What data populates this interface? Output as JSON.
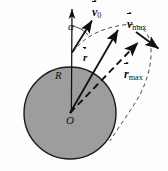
{
  "figure": {
    "width": 168,
    "height": 171,
    "background_color": "#fdfdfd"
  },
  "sphere": {
    "name": "planet-body",
    "center": {
      "x": 70,
      "y": 113
    },
    "radius": 46,
    "fill_color": "#9d9d9d",
    "stroke_color": "#1a1a1a",
    "stroke_width": 1.3
  },
  "labels": {
    "v0": {
      "symbol": "v",
      "subscript": "0",
      "vector": true,
      "text": "v0"
    },
    "vmax": {
      "symbol": "v",
      "subscript": "max",
      "vector": true,
      "text": "vmax"
    },
    "rmax": {
      "symbol": "r",
      "subscript": "max",
      "vector": true,
      "text": "rmax"
    },
    "r": {
      "symbol": "r",
      "subscript": "",
      "vector": true,
      "text": "r"
    },
    "alpha": {
      "symbol": "α",
      "text": "α"
    },
    "R": {
      "symbol": "R",
      "text": "R"
    },
    "O": {
      "symbol": "O",
      "text": "O"
    }
  },
  "geometry": {
    "launch_point": {
      "x": 72,
      "y": 52
    },
    "center_point": {
      "x": 70,
      "y": 113
    },
    "vertical_axis": {
      "x1": 72,
      "y1": 3,
      "x2": 70,
      "y2": 113
    },
    "v0_arrow": {
      "x1": 72,
      "y1": 52,
      "x2": 93,
      "y2": 19
    },
    "r_arrow": {
      "x1": 70,
      "y1": 113,
      "x2": 119,
      "y2": 29
    },
    "rmax_arrow": {
      "x1": 70,
      "y1": 113,
      "x2": 139,
      "y2": 42,
      "dashed": true
    },
    "vmax_arrow": {
      "x1": 136,
      "y1": 32,
      "x2": 159,
      "y2": 49
    },
    "trajectory": {
      "dashed": true,
      "apex": {
        "x": 128,
        "y": 24
      }
    },
    "angle_arc": {
      "center": {
        "x": 72,
        "y": 52
      },
      "radius": 26
    }
  },
  "colors": {
    "line": "#101010",
    "dash": "#2a2a2a",
    "sphere_fill": "#9d9d9d"
  }
}
